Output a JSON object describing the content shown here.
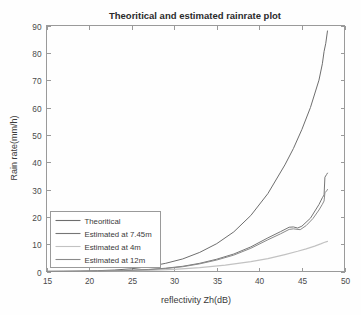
{
  "chart_data": {
    "type": "line",
    "title": "Theoritical and estimated rainrate plot",
    "xlabel": "reflectivity Zh(dB)",
    "ylabel": "Rain rate(mm/h)",
    "xlim": [
      15,
      50
    ],
    "ylim": [
      0,
      90
    ],
    "xticks": [
      15,
      20,
      25,
      30,
      35,
      40,
      45,
      50
    ],
    "yticks": [
      0,
      10,
      20,
      30,
      40,
      50,
      60,
      70,
      80,
      90
    ],
    "grid": false,
    "legend_position": "lower-left",
    "series": [
      {
        "name": "Theoritical",
        "color": "#6e6e6e",
        "width": 1.0,
        "x": [
          15,
          17,
          19,
          21,
          23,
          25,
          27,
          29,
          31,
          33,
          35,
          37,
          39,
          41,
          43,
          44,
          45,
          46,
          47,
          47.4,
          47.6,
          47.8,
          48
        ],
        "values": [
          0.05,
          0.09,
          0.16,
          0.3,
          0.55,
          1.0,
          1.8,
          3.0,
          4.6,
          7.0,
          10.2,
          14.5,
          20.5,
          28.5,
          39.0,
          45.0,
          52.0,
          60.0,
          70.0,
          76.0,
          80.5,
          83.5,
          88.0
        ]
      },
      {
        "name": "Estimated at 7.45m",
        "color": "#767676",
        "width": 1.0,
        "x": [
          15,
          18,
          21,
          24,
          27,
          29,
          31,
          33,
          35,
          37,
          39,
          41,
          42.5,
          43.5,
          44,
          44.5,
          45,
          46,
          47,
          47.4,
          47.6,
          47.7,
          47.9,
          48
        ],
        "values": [
          0.02,
          0.06,
          0.14,
          0.32,
          0.75,
          1.2,
          1.9,
          3.0,
          4.5,
          6.4,
          9.0,
          12.3,
          14.6,
          16.2,
          16.3,
          15.9,
          16.6,
          19.5,
          24.5,
          27.0,
          28.0,
          34.5,
          35.5,
          36.0
        ]
      },
      {
        "name": "Estimated at 4m",
        "color": "#c2c2c2",
        "width": 1.2,
        "x": [
          15,
          18,
          21,
          24,
          27,
          30,
          33,
          36,
          39,
          41,
          43,
          44.5,
          45.5,
          46.5,
          47.2,
          47.6,
          48
        ],
        "values": [
          0.02,
          0.05,
          0.1,
          0.2,
          0.4,
          0.8,
          1.4,
          2.3,
          3.6,
          4.7,
          6.2,
          7.4,
          8.3,
          9.3,
          10.1,
          10.6,
          11.0
        ]
      },
      {
        "name": "Estimated at 12m",
        "color": "#8a8a8a",
        "width": 1.0,
        "x": [
          15,
          18,
          21,
          24,
          27,
          29,
          31,
          33,
          35,
          37,
          39,
          41,
          42.5,
          43.5,
          44,
          44.8,
          45.5,
          46.3,
          47,
          47.4,
          47.6,
          47.7,
          47.9,
          48
        ],
        "values": [
          0.02,
          0.05,
          0.12,
          0.28,
          0.68,
          1.1,
          1.75,
          2.8,
          4.2,
          6.0,
          8.5,
          11.6,
          13.8,
          15.4,
          15.6,
          15.3,
          16.8,
          19.4,
          22.5,
          24.6,
          25.8,
          28.8,
          29.5,
          30.0
        ]
      }
    ]
  },
  "legend": {
    "items": [
      {
        "label": "Theoritical"
      },
      {
        "label": "Estimated at 7.45m"
      },
      {
        "label": "Estimated at 4m"
      },
      {
        "label": "Estimated at 12m"
      }
    ]
  }
}
